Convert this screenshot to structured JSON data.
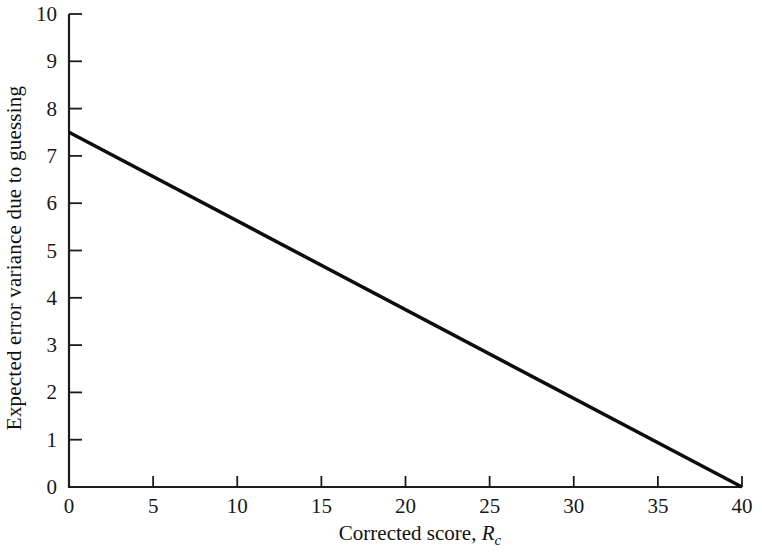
{
  "figure": {
    "background": "#ffffff",
    "text_color": "#181818"
  },
  "chart_data": {
    "type": "line",
    "title": "",
    "ylabel": "Expected error variance due to guessing",
    "xlabel_prefix": "Corrected score, ",
    "xlabel_var": "R",
    "xlabel_sub": "c",
    "xlim": [
      0,
      40
    ],
    "ylim": [
      0,
      10
    ],
    "x_ticks": [
      0,
      5,
      10,
      15,
      20,
      25,
      30,
      35,
      40
    ],
    "y_ticks": [
      0,
      1,
      2,
      3,
      4,
      5,
      6,
      7,
      8,
      9,
      10
    ],
    "grid": false,
    "legend": "none",
    "axis_color": "#1c1c1c",
    "line_color": "#0d0d0d",
    "line_width": 3.5,
    "series": [
      {
        "name": "expected-error-variance-line",
        "points": [
          [
            0,
            7.5
          ],
          [
            40,
            0
          ]
        ]
      }
    ]
  }
}
